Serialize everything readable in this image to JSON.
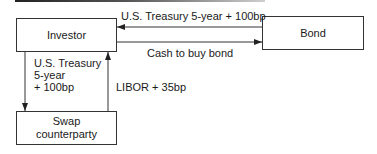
{
  "diagram": {
    "nodes": {
      "investor": {
        "label": "Investor"
      },
      "bond": {
        "label": "Bond"
      },
      "swap_counterparty": {
        "label": "Swap counterparty",
        "lines": [
          "Swap",
          "counterparty"
        ]
      }
    },
    "edges": {
      "bond_to_investor": {
        "from": "Bond",
        "to": "Investor",
        "label": "U.S. Treasury 5-year + 100bp"
      },
      "investor_to_bond": {
        "from": "Investor",
        "to": "Bond",
        "label": "Cash to buy bond"
      },
      "investor_to_swap": {
        "from": "Investor",
        "to": "Swap counterparty",
        "label": "U.S. Treasury 5-year + 100bp",
        "lines": [
          "U.S. Treasury",
          "5-year",
          "+ 100bp"
        ]
      },
      "swap_to_investor": {
        "from": "Swap counterparty",
        "to": "Investor",
        "label": "LIBOR + 35bp"
      }
    },
    "colors": {
      "line": "#333333",
      "text": "#1a1a1a",
      "background": "#ffffff"
    }
  }
}
